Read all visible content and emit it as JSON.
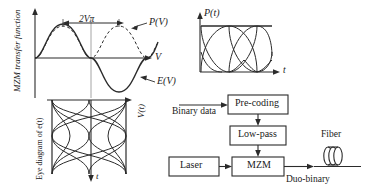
{
  "transfer_plot": {
    "y_axis_label": "MZM transfer function",
    "x_axis_label": "V",
    "span_label": "2Vπ",
    "field_curve_label": "E(V)",
    "power_curve_label": "P(V)",
    "curves": {
      "field": {
        "name": "E(V)",
        "style": "solid",
        "description": "full sine: positive lobe then negative lobe"
      },
      "power": {
        "name": "P(V)",
        "style": "dashed",
        "description": "squared sine: two positive lobes"
      }
    }
  },
  "drive_eye": {
    "y_axis_label": "V(t)",
    "x_axis_label": "t",
    "caption": "Eye diagram of e(t)",
    "levels": 3
  },
  "optical_eye": {
    "y_axis_label": "P(t)",
    "x_axis_label": "t",
    "levels": 2,
    "description": "duo-binary optical power eye with two open eyes"
  },
  "block_diagram": {
    "input_label": "Binary data",
    "output_label": "Duo-binary",
    "fiber_label": "Fiber",
    "blocks": [
      {
        "id": "precoding",
        "label": "Pre-coding"
      },
      {
        "id": "lowpass",
        "label": "Low-pass"
      },
      {
        "id": "laser",
        "label": "Laser"
      },
      {
        "id": "mzm",
        "label": "MZM"
      }
    ],
    "fiber_icon": "fiber-coil-icon"
  },
  "colors": {
    "ink": "#1a1a1a",
    "line": "#2b2b2b",
    "box_fill": "#ffffff",
    "background": "#ffffff"
  }
}
